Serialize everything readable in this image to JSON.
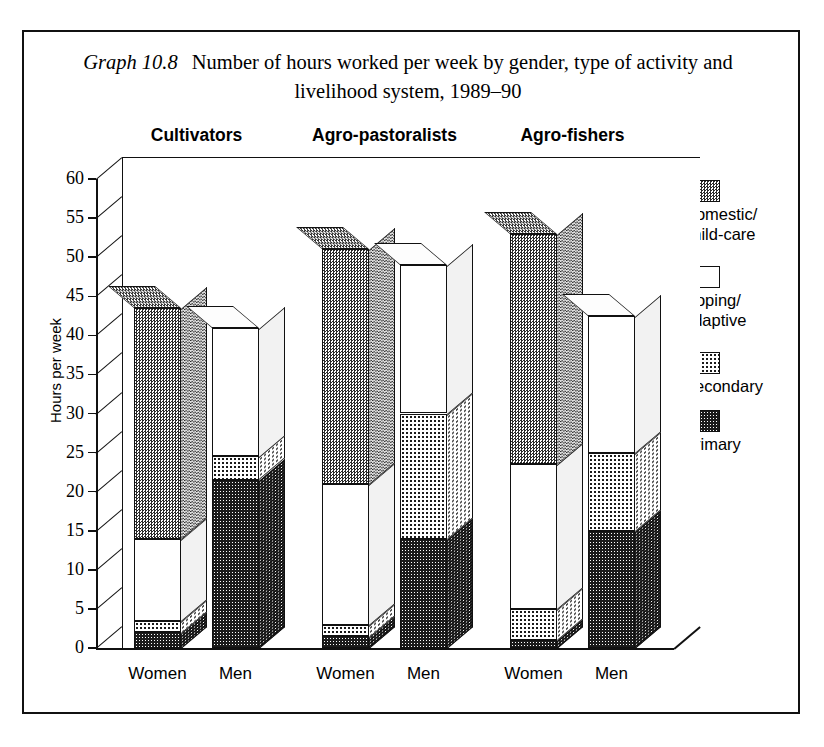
{
  "caption": {
    "label": "Graph 10.8",
    "text": "Number of hours worked per week by gender, type of activity and livelihood system, 1989–90"
  },
  "chart_data": {
    "type": "bar",
    "title": "Number of hours worked per week by gender, type of activity and livelihood system, 1989–90",
    "subtitle": "Graph 10.8",
    "stacked": true,
    "three_d": true,
    "xlabel": "",
    "ylabel": "Hours per week",
    "ylim": [
      0,
      60
    ],
    "ytick_step": 5,
    "yticks": [
      0,
      5,
      10,
      15,
      20,
      25,
      30,
      35,
      40,
      45,
      50,
      55,
      60
    ],
    "grid": true,
    "legend_position": "right",
    "groups": [
      "Cultivators",
      "Agro-pastoralists",
      "Agro-fishers"
    ],
    "categories": [
      "Cultivators – Women",
      "Cultivators – Men",
      "Agro-pastoralists – Women",
      "Agro-pastoralists – Men",
      "Agro-fishers – Women",
      "Agro-fishers – Men"
    ],
    "series": [
      {
        "name": "Primary",
        "values": [
          2.0,
          21.5,
          1.5,
          14.0,
          1.0,
          15.0
        ]
      },
      {
        "name": "Secondary",
        "values": [
          1.5,
          3.0,
          1.5,
          16.0,
          4.0,
          10.0
        ]
      },
      {
        "name": "Coping/adaptive",
        "values": [
          10.5,
          16.5,
          18.0,
          19.0,
          18.5,
          17.5
        ]
      },
      {
        "name": "Domestic/child-care",
        "values": [
          29.5,
          0.0,
          30.0,
          0.0,
          29.5,
          0.0
        ]
      }
    ],
    "totals": [
      43.5,
      41.0,
      51.0,
      49.0,
      53.0,
      42.5
    ]
  },
  "axis": {
    "y_title": "Hours per week",
    "y_labels": [
      "60",
      "55",
      "50",
      "45",
      "40",
      "35",
      "30",
      "25",
      "20",
      "15",
      "10",
      "5",
      "0"
    ]
  },
  "group_headers": [
    {
      "label": "Cultivators"
    },
    {
      "label": "Agro-pastoralists"
    },
    {
      "label": "Agro-fishers"
    }
  ],
  "x_labels": [
    {
      "label": "Women"
    },
    {
      "label": "Men"
    },
    {
      "label": "Women"
    },
    {
      "label": "Men"
    },
    {
      "label": "Women"
    },
    {
      "label": "Men"
    }
  ],
  "legend": {
    "items": [
      {
        "label": "Domestic/\nchild-care",
        "pattern": "domestic"
      },
      {
        "label": "Coping/\nadaptive",
        "pattern": "coping"
      },
      {
        "label": "Secondary",
        "pattern": "secondary"
      },
      {
        "label": "Primary",
        "pattern": "primary"
      }
    ]
  },
  "colors": {
    "ink": "#111111",
    "paper": "#ffffff",
    "primary": "#1b1b1b",
    "secondary": "#ffffff",
    "coping": "#ffffff",
    "domestic": "#9a9a9a"
  }
}
